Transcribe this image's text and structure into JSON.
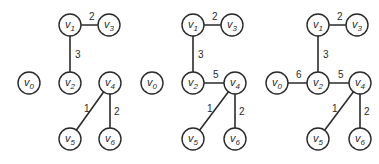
{
  "diagram": {
    "node_radius": 11,
    "stroke_color": "#2a2a2a",
    "panels": [
      {
        "id": "panel-1",
        "nodes": [
          {
            "id": "v0",
            "base": "v",
            "sub": "0",
            "x": 29,
            "y": 83
          },
          {
            "id": "v1",
            "base": "v",
            "sub": "1",
            "x": 70,
            "y": 25
          },
          {
            "id": "v2",
            "base": "v",
            "sub": "2",
            "x": 70,
            "y": 83
          },
          {
            "id": "v3",
            "base": "v",
            "sub": "3",
            "x": 109,
            "y": 25
          },
          {
            "id": "v4",
            "base": "v",
            "sub": "4",
            "x": 110,
            "y": 83
          },
          {
            "id": "v5",
            "base": "v",
            "sub": "5",
            "x": 70,
            "y": 139
          },
          {
            "id": "v6",
            "base": "v",
            "sub": "6",
            "x": 110,
            "y": 139
          }
        ],
        "edges": [
          {
            "from": "v1",
            "to": "v3",
            "weight": "2",
            "lx": 89,
            "ly": 20
          },
          {
            "from": "v1",
            "to": "v2",
            "weight": "3",
            "lx": 75,
            "ly": 58
          },
          {
            "from": "v4",
            "to": "v5",
            "weight": "1",
            "lx": 84,
            "ly": 112
          },
          {
            "from": "v4",
            "to": "v6",
            "weight": "2",
            "lx": 114,
            "ly": 115
          }
        ]
      },
      {
        "id": "panel-2",
        "nodes": [
          {
            "id": "v0",
            "base": "v",
            "sub": "0",
            "x": 152,
            "y": 83
          },
          {
            "id": "v1",
            "base": "v",
            "sub": "1",
            "x": 193,
            "y": 25
          },
          {
            "id": "v2",
            "base": "v",
            "sub": "2",
            "x": 193,
            "y": 83
          },
          {
            "id": "v3",
            "base": "v",
            "sub": "3",
            "x": 232,
            "y": 25
          },
          {
            "id": "v4",
            "base": "v",
            "sub": "4",
            "x": 235,
            "y": 83
          },
          {
            "id": "v5",
            "base": "v",
            "sub": "5",
            "x": 193,
            "y": 139
          },
          {
            "id": "v6",
            "base": "v",
            "sub": "6",
            "x": 235,
            "y": 139
          }
        ],
        "edges": [
          {
            "from": "v1",
            "to": "v3",
            "weight": "2",
            "lx": 212,
            "ly": 20
          },
          {
            "from": "v1",
            "to": "v2",
            "weight": "3",
            "lx": 198,
            "ly": 58
          },
          {
            "from": "v2",
            "to": "v4",
            "weight": "5",
            "lx": 213,
            "ly": 78
          },
          {
            "from": "v4",
            "to": "v5",
            "weight": "1",
            "lx": 207,
            "ly": 112
          },
          {
            "from": "v4",
            "to": "v6",
            "weight": "2",
            "lx": 239,
            "ly": 115
          }
        ]
      },
      {
        "id": "panel-3",
        "nodes": [
          {
            "id": "v0",
            "base": "v",
            "sub": "0",
            "x": 277,
            "y": 83
          },
          {
            "id": "v1",
            "base": "v",
            "sub": "1",
            "x": 318,
            "y": 25
          },
          {
            "id": "v2",
            "base": "v",
            "sub": "2",
            "x": 318,
            "y": 83
          },
          {
            "id": "v3",
            "base": "v",
            "sub": "3",
            "x": 357,
            "y": 25
          },
          {
            "id": "v4",
            "base": "v",
            "sub": "4",
            "x": 360,
            "y": 83
          },
          {
            "id": "v5",
            "base": "v",
            "sub": "5",
            "x": 318,
            "y": 139
          },
          {
            "id": "v6",
            "base": "v",
            "sub": "6",
            "x": 360,
            "y": 139
          }
        ],
        "edges": [
          {
            "from": "v1",
            "to": "v3",
            "weight": "2",
            "lx": 337,
            "ly": 20
          },
          {
            "from": "v1",
            "to": "v2",
            "weight": "3",
            "lx": 323,
            "ly": 58
          },
          {
            "from": "v0",
            "to": "v2",
            "weight": "6",
            "lx": 296,
            "ly": 78
          },
          {
            "from": "v2",
            "to": "v4",
            "weight": "5",
            "lx": 338,
            "ly": 78
          },
          {
            "from": "v4",
            "to": "v5",
            "weight": "1",
            "lx": 332,
            "ly": 112
          },
          {
            "from": "v4",
            "to": "v6",
            "weight": "2",
            "lx": 364,
            "ly": 115
          }
        ]
      }
    ]
  }
}
